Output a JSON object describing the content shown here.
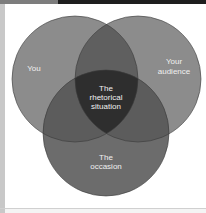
{
  "diagram": {
    "type": "venn",
    "sets": [
      {
        "label": "You",
        "color": "#8a8a8a"
      },
      {
        "label_lines": [
          "Your",
          "audience"
        ],
        "color": "#8a8a8a"
      },
      {
        "label_lines": [
          "The",
          "occasion"
        ],
        "color": "#6e6e6e"
      }
    ],
    "center_label_lines": [
      "The",
      "rhetorical",
      "situation"
    ],
    "colors": {
      "single": "#8c8c8c",
      "pair_overlap": "#5f5f5f",
      "occasion": "#6c6c6c",
      "center": "#2e2e2e",
      "stroke": "#333333"
    }
  }
}
